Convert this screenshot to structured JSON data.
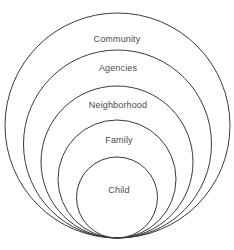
{
  "diagram": {
    "type": "nested-concentric-circles",
    "title": "",
    "canvas": {
      "width": 234,
      "height": 250,
      "background": "#ffffff"
    },
    "style": {
      "stroke_color": "#3a3a3a",
      "stroke_width": 1,
      "fill": "none",
      "label_color": "#4a4a4a",
      "label_font_size": 9
    },
    "rings": [
      {
        "label": "Community",
        "level": 1,
        "cx": 117.5,
        "cy": 125.5,
        "r": 112.5,
        "label_x": 117,
        "label_y": 39
      },
      {
        "label": "Agencies",
        "level": 2,
        "cx": 117.5,
        "cy": 144,
        "r": 94,
        "label_x": 118,
        "label_y": 68
      },
      {
        "label": "Neighborhood",
        "level": 3,
        "cx": 117,
        "cy": 162,
        "r": 76,
        "label_x": 118,
        "label_y": 105
      },
      {
        "label": "Family",
        "level": 4,
        "cx": 117,
        "cy": 179,
        "r": 59,
        "label_x": 119,
        "label_y": 140
      },
      {
        "label": "Child",
        "level": 5,
        "cx": 117,
        "cy": 197.5,
        "r": 40.5,
        "label_x": 119,
        "label_y": 190
      }
    ]
  }
}
